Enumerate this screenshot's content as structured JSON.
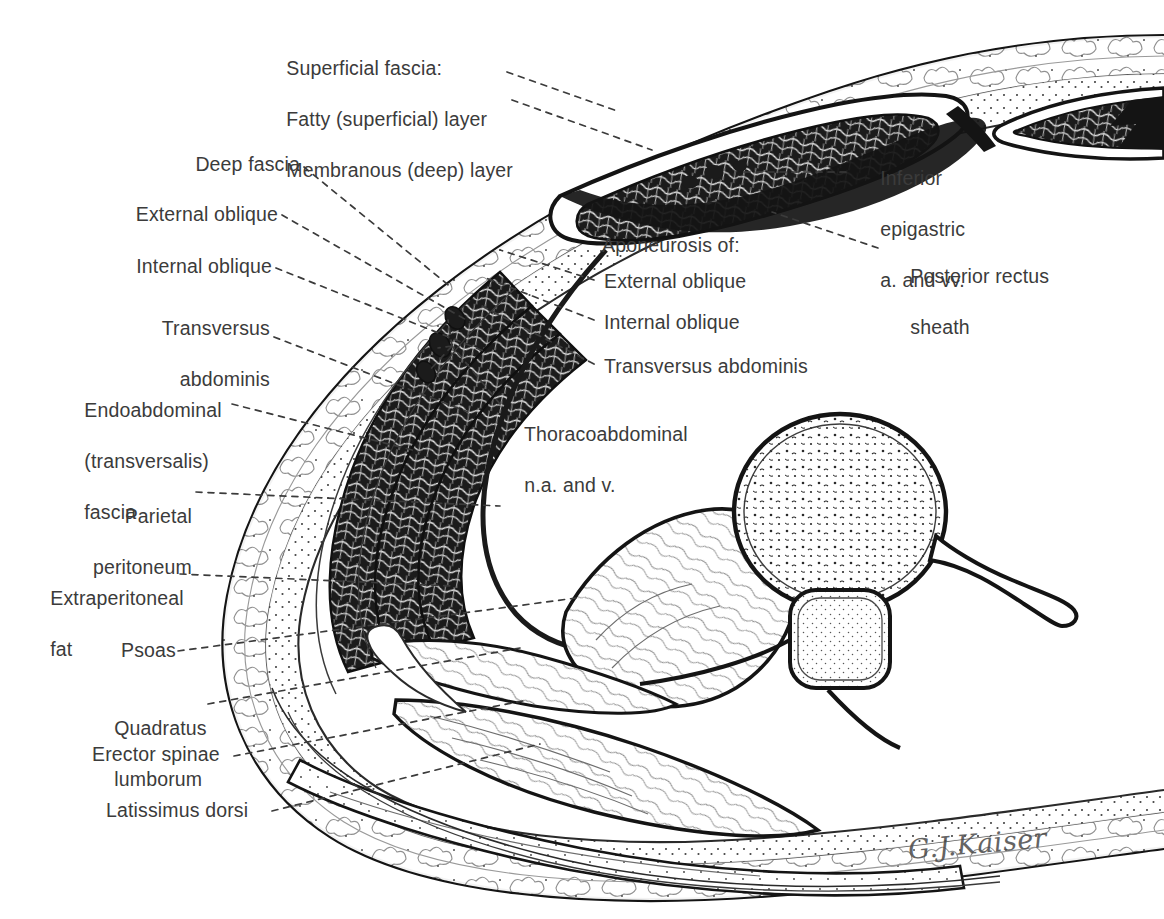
{
  "figure": {
    "kind": "anatomical-line-drawing",
    "background_color": "#ffffff",
    "ink_color": "#1a1a1a",
    "text_color": "#3b3b3b",
    "leader_line_style": "dashed"
  },
  "signature": {
    "text": "G.J.Kaiser"
  },
  "labels": {
    "superficial_fascia": {
      "heading": "Superficial fascia:",
      "line2": "Fatty (superficial) layer",
      "line3": "Membranous (deep) layer"
    },
    "deep_fascia": "Deep fascia",
    "external_oblique": "External oblique",
    "internal_oblique": "Internal oblique",
    "transversus_abdominis_l1": "Transversus",
    "transversus_abdominis_l2": "abdominis",
    "endoabdominal_l1": "Endoabdominal",
    "endoabdominal_l2": "(transversalis)",
    "endoabdominal_l3": "fascia",
    "parietal_peritoneum_l1": "Parietal",
    "parietal_peritoneum_l2": "peritoneum",
    "extraperitoneal_fat_l1": "Extraperitoneal",
    "extraperitoneal_fat_l2": "fat",
    "psoas": "Psoas",
    "quadratus_lumborum_l1": "Quadratus",
    "quadratus_lumborum_l2": "lumborum",
    "erector_spinae": "Erector spinae",
    "latissimus_dorsi": "Latissimus dorsi",
    "aponeurosis_heading": "Aponeurosis of:",
    "aponeurosis_external_oblique": "External oblique",
    "aponeurosis_internal_oblique": "Internal oblique",
    "aponeurosis_transversus_abdominis": "Transversus abdominis",
    "thoracoabdominal_l1": "Thoracoabdominal",
    "thoracoabdominal_l2": "n.a. and v.",
    "inferior_epigastric_l1": "Inferior",
    "inferior_epigastric_l2": "epigastric",
    "inferior_epigastric_l3": "a. and vv.",
    "posterior_rectus_sheath_l1": "Posterior rectus",
    "posterior_rectus_sheath_l2": "sheath"
  }
}
